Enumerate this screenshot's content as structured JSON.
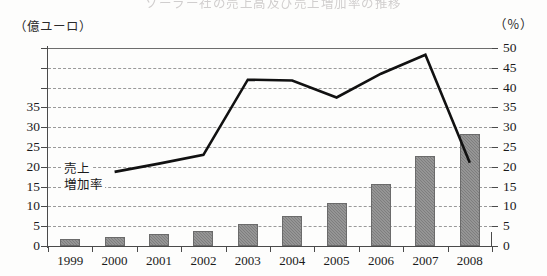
{
  "title": "ソーラー社の売上高及び売上増加率の推移",
  "units": {
    "left": "（億ユーロ）",
    "right": "（％）"
  },
  "legend": {
    "sales_line_1": "売上",
    "sales_line_2": "増加率"
  },
  "chart_data": {
    "type": "bar",
    "title": "ソーラー社の売上高及び売上増加率の推移",
    "categories": [
      "1999",
      "2000",
      "2001",
      "2002",
      "2003",
      "2004",
      "2005",
      "2006",
      "2007",
      "2008"
    ],
    "series": [
      {
        "name": "売上",
        "type": "bar",
        "axis": "left",
        "unit": "億ユーロ",
        "values": [
          1.7,
          2.4,
          3.0,
          3.9,
          5.6,
          7.5,
          10.8,
          15.7,
          22.8,
          28.4
        ],
        "color": "#8c8c8c"
      },
      {
        "name": "増加率",
        "type": "line",
        "axis": "right",
        "unit": "%",
        "values": [
          null,
          18.7,
          20.8,
          23.0,
          42.0,
          41.8,
          37.5,
          43.5,
          48.3,
          21.0
        ],
        "color": "#111111"
      }
    ],
    "xlabel": "",
    "ylabel_left": "億ユーロ",
    "ylabel_right": "%",
    "ylim_left": [
      0,
      50
    ],
    "ylim_right": [
      0,
      50
    ],
    "yticks_left_labeled": [
      "0",
      "5",
      "10",
      "15",
      "20",
      "25",
      "30",
      "35"
    ],
    "yticks_left_all": [
      0,
      5,
      10,
      15,
      20,
      25,
      30,
      35,
      40,
      45,
      50
    ],
    "yticks_right": [
      "0",
      "5",
      "10",
      "15",
      "20",
      "25",
      "30",
      "35",
      "40",
      "45",
      "50"
    ],
    "grid": true,
    "legend_position": "inside-left"
  }
}
